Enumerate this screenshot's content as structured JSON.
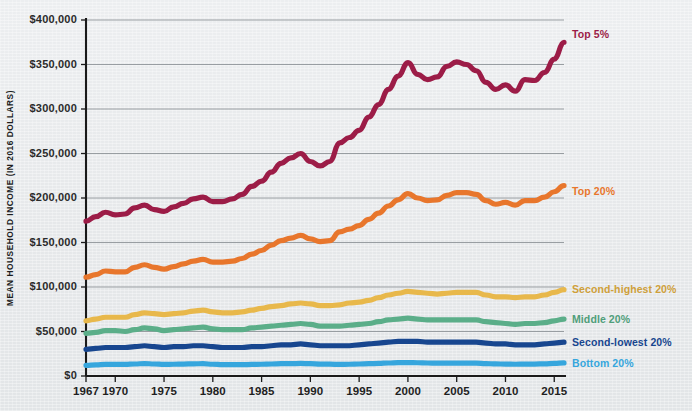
{
  "chart_data": {
    "type": "line",
    "title": "",
    "xlabel": "",
    "ylabel": "MEAN HOUSEHOLD INCOME (IN 2016 DOLLARS)",
    "xlim": [
      1967,
      2016
    ],
    "ylim": [
      0,
      400000
    ],
    "grid": true,
    "legend_position": "right-inline",
    "y_ticks": [
      0,
      50000,
      100000,
      150000,
      200000,
      250000,
      300000,
      350000,
      400000
    ],
    "y_tick_labels": [
      "$0",
      "$50,000",
      "$100,000",
      "$150,000",
      "$200,000",
      "$250,000",
      "$300,000",
      "$350,000",
      "$400,000"
    ],
    "x_ticks": [
      1967,
      1970,
      1975,
      1980,
      1985,
      1990,
      1995,
      2000,
      2005,
      2010,
      2015
    ],
    "x_tick_labels": [
      "1967",
      "1970",
      "1975",
      "1980",
      "1985",
      "1990",
      "1995",
      "2000",
      "2005",
      "2010",
      "2015"
    ],
    "x": [
      1967,
      1968,
      1969,
      1970,
      1971,
      1972,
      1973,
      1974,
      1975,
      1976,
      1977,
      1978,
      1979,
      1980,
      1981,
      1982,
      1983,
      1984,
      1985,
      1986,
      1987,
      1988,
      1989,
      1990,
      1991,
      1992,
      1993,
      1994,
      1995,
      1996,
      1997,
      1998,
      1999,
      2000,
      2001,
      2002,
      2003,
      2004,
      2005,
      2006,
      2007,
      2008,
      2009,
      2010,
      2011,
      2012,
      2013,
      2014,
      2015,
      2016
    ],
    "series": [
      {
        "name": "Top 5%",
        "color": "#9c1c47",
        "label_color": "#9c1c47",
        "values": [
          174000,
          179000,
          184000,
          181000,
          182000,
          189000,
          192000,
          187000,
          185000,
          190000,
          194000,
          199000,
          201000,
          196000,
          196000,
          199000,
          204000,
          213000,
          219000,
          229000,
          239000,
          245000,
          250000,
          241000,
          236000,
          241000,
          262000,
          268000,
          276000,
          291000,
          305000,
          322000,
          337000,
          352000,
          339000,
          333000,
          336000,
          348000,
          353000,
          350000,
          343000,
          330000,
          322000,
          327000,
          320000,
          333000,
          332000,
          341000,
          356000,
          375000
        ],
        "label_x": 2017,
        "label_y": 383000
      },
      {
        "name": "Top 20%",
        "color": "#e8762c",
        "label_color": "#e8762c",
        "values": [
          111000,
          114000,
          118000,
          117000,
          117000,
          122000,
          125000,
          122000,
          120000,
          123000,
          126000,
          129000,
          131000,
          128000,
          128000,
          129000,
          132000,
          137000,
          141000,
          147000,
          152000,
          155000,
          158000,
          154000,
          151000,
          152000,
          162000,
          165000,
          169000,
          176000,
          183000,
          191000,
          198000,
          205000,
          200000,
          197000,
          198000,
          203000,
          206000,
          206000,
          204000,
          197000,
          193000,
          195000,
          192000,
          197000,
          197000,
          201000,
          207000,
          214000
        ],
        "label_x": 2017,
        "label_y": 206000
      },
      {
        "name": "Second-highest 20%",
        "color": "#e8b84b",
        "label_color": "#cfa03a",
        "values": [
          62000,
          64000,
          66000,
          66000,
          66000,
          69000,
          71000,
          70000,
          69000,
          70000,
          71000,
          73000,
          74000,
          72000,
          71000,
          71000,
          72000,
          74000,
          76000,
          78000,
          79000,
          81000,
          82000,
          81000,
          79000,
          79000,
          80000,
          82000,
          83000,
          85000,
          88000,
          91000,
          93000,
          95000,
          94000,
          93000,
          92000,
          93000,
          94000,
          94000,
          94000,
          91000,
          89000,
          89000,
          88000,
          89000,
          89000,
          91000,
          94000,
          97000
        ],
        "label_x": 2017,
        "label_y": 96000
      },
      {
        "name": "Middle 20%",
        "color": "#5bae89",
        "label_color": "#4f9e7a",
        "values": [
          48000,
          49000,
          51000,
          51000,
          50000,
          52000,
          54000,
          53000,
          51000,
          52000,
          53000,
          54000,
          55000,
          53000,
          52000,
          52000,
          52000,
          54000,
          55000,
          56000,
          57000,
          58000,
          59000,
          58000,
          56000,
          56000,
          56000,
          57000,
          58000,
          59000,
          61000,
          63000,
          64000,
          65000,
          64000,
          63000,
          63000,
          63000,
          63000,
          63000,
          63000,
          61000,
          60000,
          59000,
          58000,
          59000,
          59000,
          60000,
          62000,
          64000
        ],
        "label_x": 2017,
        "label_y": 63000
      },
      {
        "name": "Second-lowest 20%",
        "color": "#17468f",
        "label_color": "#17468f",
        "values": [
          30000,
          31000,
          32000,
          32000,
          32000,
          33000,
          34000,
          33000,
          32000,
          33000,
          33000,
          34000,
          34000,
          33000,
          32000,
          32000,
          32000,
          33000,
          33000,
          34000,
          35000,
          35000,
          36000,
          35000,
          34000,
          34000,
          34000,
          34000,
          35000,
          36000,
          37000,
          38000,
          39000,
          39000,
          39000,
          38000,
          38000,
          38000,
          38000,
          38000,
          38000,
          37000,
          36000,
          36000,
          35000,
          35000,
          35000,
          36000,
          37000,
          38000
        ],
        "label_x": 2017,
        "label_y": 37000
      },
      {
        "name": "Bottom 20%",
        "color": "#36a6dd",
        "label_color": "#36a6dd",
        "values": [
          12000,
          12500,
          13000,
          13000,
          13000,
          13500,
          14000,
          13500,
          13000,
          13200,
          13400,
          13700,
          13800,
          13200,
          12800,
          12700,
          12700,
          13000,
          13200,
          13500,
          13800,
          13900,
          14100,
          13800,
          13400,
          13300,
          13000,
          13200,
          13500,
          13800,
          14200,
          14600,
          15000,
          15100,
          14900,
          14600,
          14400,
          14400,
          14400,
          14500,
          14500,
          14000,
          13600,
          13400,
          13200,
          13300,
          13400,
          13700,
          14200,
          14700
        ],
        "label_x": 2017,
        "label_y": 13200
      }
    ]
  },
  "axis": {
    "y_title": "MEAN HOUSEHOLD INCOME (IN 2016 DOLLARS)"
  }
}
